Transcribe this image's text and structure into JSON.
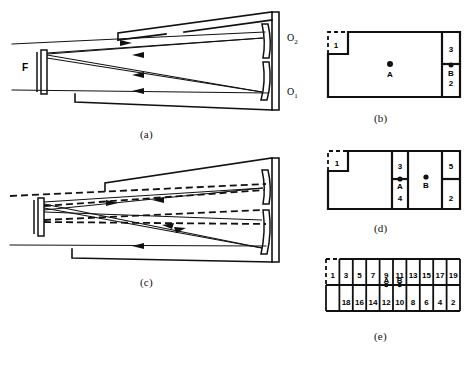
{
  "figure": {
    "captions": [
      {
        "id": "a",
        "text": "(a)"
      },
      {
        "id": "b",
        "text": "(b)"
      },
      {
        "id": "c",
        "text": "(c)"
      },
      {
        "id": "d",
        "text": "(d)"
      },
      {
        "id": "e",
        "text": "(e)"
      }
    ]
  },
  "panel_a": {
    "caption": "(a)",
    "labels": {
      "flat_mirror": "F",
      "curved_upper": "O",
      "curved_upper_sub": "2",
      "curved_lower": "O",
      "curved_lower_sub": "1"
    },
    "description": "Unfolded ray trace between flat mirror F and curved mirrors O1, O2 with solid-line rays and direction arrowheads",
    "ray_style": "solid",
    "arrow_count": 4
  },
  "panel_c": {
    "caption": "(c)",
    "description": "Same resonator as (a) with an additional misaligned ray set drawn as dashed lines overlaying the solid rays",
    "ray_style": "solid-and-dashed",
    "arrow_count": 5
  },
  "panel_b": {
    "caption": "(b)",
    "cells": [
      {
        "name": "left-dashed-cell",
        "label": "1",
        "dashed": true
      },
      {
        "name": "right-upper-dashed-cell",
        "label": "3",
        "dashed": true
      },
      {
        "name": "right-lower-cell",
        "label": "2",
        "dashed": false
      }
    ],
    "spots": [
      {
        "label": "A",
        "x_frac": 0.5,
        "y_frac": 0.52
      },
      {
        "label": "B",
        "x_frac": 0.905,
        "y_frac": 0.52
      }
    ]
  },
  "panel_d": {
    "caption": "(d)",
    "cells": [
      {
        "name": "left-dashed-cell",
        "label": "1",
        "dashed": true
      },
      {
        "name": "center-upper-cell",
        "label": "3",
        "dashed": false
      },
      {
        "name": "center-lower-cell",
        "label": "4",
        "dashed": false
      },
      {
        "name": "right-upper-dashed-cell",
        "label": "5",
        "dashed": true
      },
      {
        "name": "right-lower-cell",
        "label": "2",
        "dashed": false
      }
    ],
    "spots": [
      {
        "label": "A",
        "x_frac": 0.555,
        "y_frac": 0.5
      },
      {
        "label": "B",
        "x_frac": 0.775,
        "y_frac": 0.5
      }
    ]
  },
  "panel_e": {
    "caption": "(e)",
    "top_row": [
      "1",
      "3",
      "5",
      "7",
      "9",
      "11",
      "13",
      "15",
      "17",
      "19"
    ],
    "bottom_row": [
      "",
      "18",
      "16",
      "14",
      "12",
      "10",
      "8",
      "6",
      "4",
      "2"
    ],
    "spots": [
      {
        "label": "A",
        "cell_index": 4
      },
      {
        "label": "B",
        "cell_index": 5
      }
    ],
    "dashed_cell_index": 0,
    "columns": 10
  },
  "colors": {
    "ink": "#000000",
    "paper": "#ffffff",
    "rule": "#1a1a1a"
  }
}
